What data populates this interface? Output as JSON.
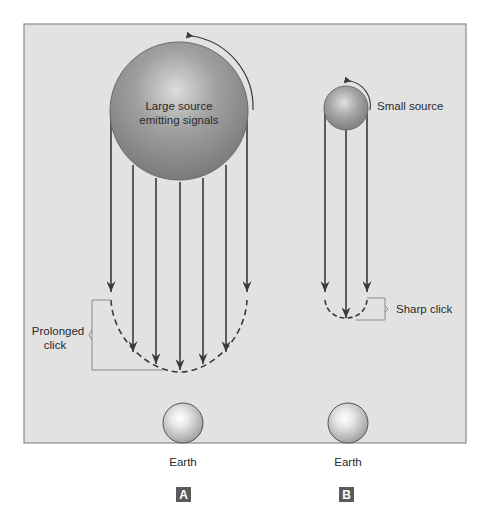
{
  "figure": {
    "background": "#e2e2e2",
    "frame_color": "#8a8a8a",
    "panels": [
      {
        "id": "A",
        "label": "A",
        "source": {
          "label_line1": "Large source",
          "label_line2": "emitting signals",
          "size": "large"
        },
        "signal_count": 7,
        "bracket_label_line1": "Prolonged",
        "bracket_label_line2": "click",
        "earth_label": "Earth"
      },
      {
        "id": "B",
        "label": "B",
        "source": {
          "label": "Small source",
          "size": "small"
        },
        "signal_count": 3,
        "bracket_label": "Sharp click",
        "earth_label": "Earth"
      }
    ],
    "colors": {
      "source_fill": "#8c8c8c",
      "source_highlight": "#d8d8d8",
      "earth_fill": "#bdbdbd",
      "earth_highlight": "#ffffff",
      "line": "#3a3a3a",
      "panel_label_bg": "#5a5a5a"
    }
  }
}
